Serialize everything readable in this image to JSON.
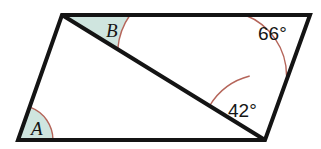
{
  "figure": {
    "type": "parallelogram-with-diagonal",
    "background_color": "#ffffff",
    "edge_color": "#141414",
    "edge_width": 4,
    "diagonal_color": "#141414",
    "diagonal_width": 4,
    "arc_stroke_color": "#b5655a",
    "arc_fill_color": "#cfe5df",
    "vertices": {
      "top_left": {
        "x": 62,
        "y": 15
      },
      "top_right": {
        "x": 310,
        "y": 15
      },
      "bottom_right": {
        "x": 265,
        "y": 140
      },
      "bottom_left": {
        "x": 18,
        "y": 140
      }
    },
    "diagonal": {
      "from": {
        "x": 62,
        "y": 15
      },
      "to": {
        "x": 265,
        "y": 140
      }
    },
    "outline_path": "M 62 15 L 310 15 L 265 140 L 18 140 Z",
    "diagonal_path": "M 62 15 L 265 140"
  },
  "angles": [
    {
      "id": "angle-a",
      "label": "A",
      "label_style": "serif-italic",
      "filled": true,
      "vertex": {
        "x": 18,
        "y": 140
      },
      "label_position": {
        "x": 31,
        "y": 135
      },
      "arc_path": "M 18 140 L 53 140 A 35 35 0 0 0 30.65 107.44 Z"
    },
    {
      "id": "angle-b",
      "label": "B",
      "label_style": "serif-italic",
      "filled": true,
      "vertex": {
        "x": 62,
        "y": 15
      },
      "label_position": {
        "x": 106,
        "y": 37
      },
      "arc_path": "M 62 15 L 130 15 A 68 68 0 0 0 117.81 48.65 Z"
    },
    {
      "id": "angle-66",
      "label": "66°",
      "label_style": "sans",
      "filled": false,
      "vertex": {
        "x": 310,
        "y": 15
      },
      "label_position": {
        "x": 258,
        "y": 40
      },
      "arc_path": "M 245 15 A 65 65 0 0 1 286.55 75.71"
    },
    {
      "id": "angle-42",
      "label": "42°",
      "label_style": "sans",
      "filled": false,
      "vertex": {
        "x": 265,
        "y": 140
      },
      "label_position": {
        "x": 228,
        "y": 117
      },
      "arc_path": "M 209.8 105.5 A 66 66 0 0 1 249.7 76.0"
    }
  ]
}
